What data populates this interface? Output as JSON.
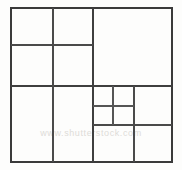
{
  "figure": {
    "kind": "nested rectangular dissection",
    "background_color": "#fdfdfc",
    "line_color": "#3f3f3f",
    "canvas": {
      "width": 182,
      "height": 170
    }
  },
  "watermark": {
    "text": "www.shutterstock.com",
    "color": "#dedcd8",
    "visible": true
  },
  "chart_data": {
    "type": "diagram",
    "xlabel": "",
    "ylabel": "",
    "xlim": [
      11,
      172
    ],
    "ylim": [
      8,
      162
    ],
    "grid": false,
    "legend": false,
    "outer_frame": {
      "x": 11,
      "y": 8,
      "width": 161,
      "height": 154
    },
    "segments": [
      {
        "name": "outer-frame",
        "kind": "rect",
        "x": 11,
        "y": 8,
        "width": 161,
        "height": 154,
        "weight": "outer"
      },
      {
        "name": "main-vertical-divider",
        "kind": "vline",
        "x": 93,
        "y1": 8,
        "y2": 162,
        "weight": "major"
      },
      {
        "name": "main-horizontal-divider",
        "kind": "hline",
        "y": 86,
        "x1": 11,
        "x2": 172,
        "weight": "major"
      },
      {
        "name": "top-left-vertical",
        "kind": "vline",
        "x": 53,
        "y1": 8,
        "y2": 86,
        "weight": "minor"
      },
      {
        "name": "top-left-horizontal",
        "kind": "hline",
        "y": 45,
        "x1": 11,
        "x2": 93,
        "weight": "minor"
      },
      {
        "name": "bottom-left-vertical",
        "kind": "vline",
        "x": 53,
        "y1": 86,
        "y2": 162,
        "weight": "minor"
      },
      {
        "name": "nested-block-right-edge",
        "kind": "vline",
        "x": 134,
        "y1": 86,
        "y2": 162,
        "weight": "minor"
      },
      {
        "name": "nested-block-bottom",
        "kind": "hline",
        "y": 125,
        "x1": 93,
        "x2": 172,
        "weight": "minor"
      },
      {
        "name": "nested-inner-vertical",
        "kind": "vline",
        "x": 113,
        "y1": 86,
        "y2": 125,
        "weight": "fine"
      },
      {
        "name": "nested-inner-horizontal",
        "kind": "hline",
        "y": 106,
        "x1": 93,
        "x2": 134,
        "weight": "fine"
      }
    ],
    "cells": [
      {
        "name": "cell-top-left-upper",
        "x": 11,
        "y": 8,
        "width": 42,
        "height": 37
      },
      {
        "name": "cell-top-mid-upper",
        "x": 53,
        "y": 8,
        "width": 40,
        "height": 37
      },
      {
        "name": "cell-top-left-lower",
        "x": 11,
        "y": 45,
        "width": 42,
        "height": 41
      },
      {
        "name": "cell-top-mid-lower",
        "x": 53,
        "y": 45,
        "width": 40,
        "height": 41
      },
      {
        "name": "cell-top-right-large",
        "x": 93,
        "y": 8,
        "width": 79,
        "height": 78
      },
      {
        "name": "cell-bottom-left-tall",
        "x": 11,
        "y": 86,
        "width": 42,
        "height": 76
      },
      {
        "name": "cell-bottom-mid-tall",
        "x": 53,
        "y": 86,
        "width": 40,
        "height": 76
      },
      {
        "name": "cell-nested-upper-left",
        "x": 93,
        "y": 86,
        "width": 20,
        "height": 20
      },
      {
        "name": "cell-nested-upper-right",
        "x": 113,
        "y": 86,
        "width": 21,
        "height": 20
      },
      {
        "name": "cell-nested-lower-left",
        "x": 93,
        "y": 106,
        "width": 20,
        "height": 19
      },
      {
        "name": "cell-nested-lower-right",
        "x": 113,
        "y": 106,
        "width": 21,
        "height": 19
      },
      {
        "name": "cell-right-mid-large",
        "x": 134,
        "y": 86,
        "width": 38,
        "height": 39
      },
      {
        "name": "cell-bottom-right-inner",
        "x": 93,
        "y": 125,
        "width": 41,
        "height": 37
      },
      {
        "name": "cell-bottom-right-outer",
        "x": 134,
        "y": 125,
        "width": 38,
        "height": 37
      }
    ],
    "counts": {
      "cells": 14,
      "segments": 10
    }
  }
}
